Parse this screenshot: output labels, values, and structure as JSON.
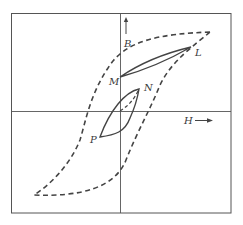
{
  "figure": {
    "axes": {
      "x_label": "H",
      "y_label": "B",
      "x_arrow": "right-arrow",
      "y_arrow": "up-arrow"
    },
    "points": {
      "L": "L",
      "M": "M",
      "N": "N",
      "P": "P"
    },
    "curves": {
      "major_loop": "dashed saturation hysteresis loop",
      "minor_loop_LM": "solid minor loop between M and L",
      "minor_loop_NP": "solid minor loop between N and P",
      "initial_curve": "dashed initial magnetization from origin to N"
    },
    "colors": {
      "line": "#3f3f3f",
      "frame": "#555555",
      "background": "#ffffff"
    }
  }
}
